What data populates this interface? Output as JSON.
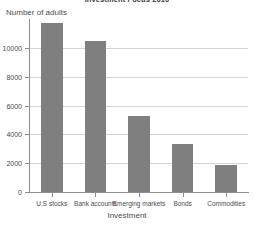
{
  "chart_data": {
    "type": "bar",
    "title": "Investment Focus 2010",
    "xlabel": "Investment",
    "ylabel": "Number of adults",
    "categories": [
      "U.S stocks",
      "Bank accounts",
      "Emerging markets",
      "Bonds",
      "Commodities"
    ],
    "values": [
      11750,
      10450,
      5250,
      3300,
      1900
    ],
    "ylim": [
      0,
      12000
    ],
    "yticks": [
      0,
      2000,
      4000,
      6000,
      8000,
      10000
    ],
    "ytick_labels": [
      "0",
      "2000",
      "4000",
      "6000",
      "8000",
      "10000"
    ],
    "grid": true,
    "legend": null,
    "bar_color": "#7f7f7f",
    "grid_color": "#d4d4d4",
    "axis_color": "#8e8e8e"
  }
}
